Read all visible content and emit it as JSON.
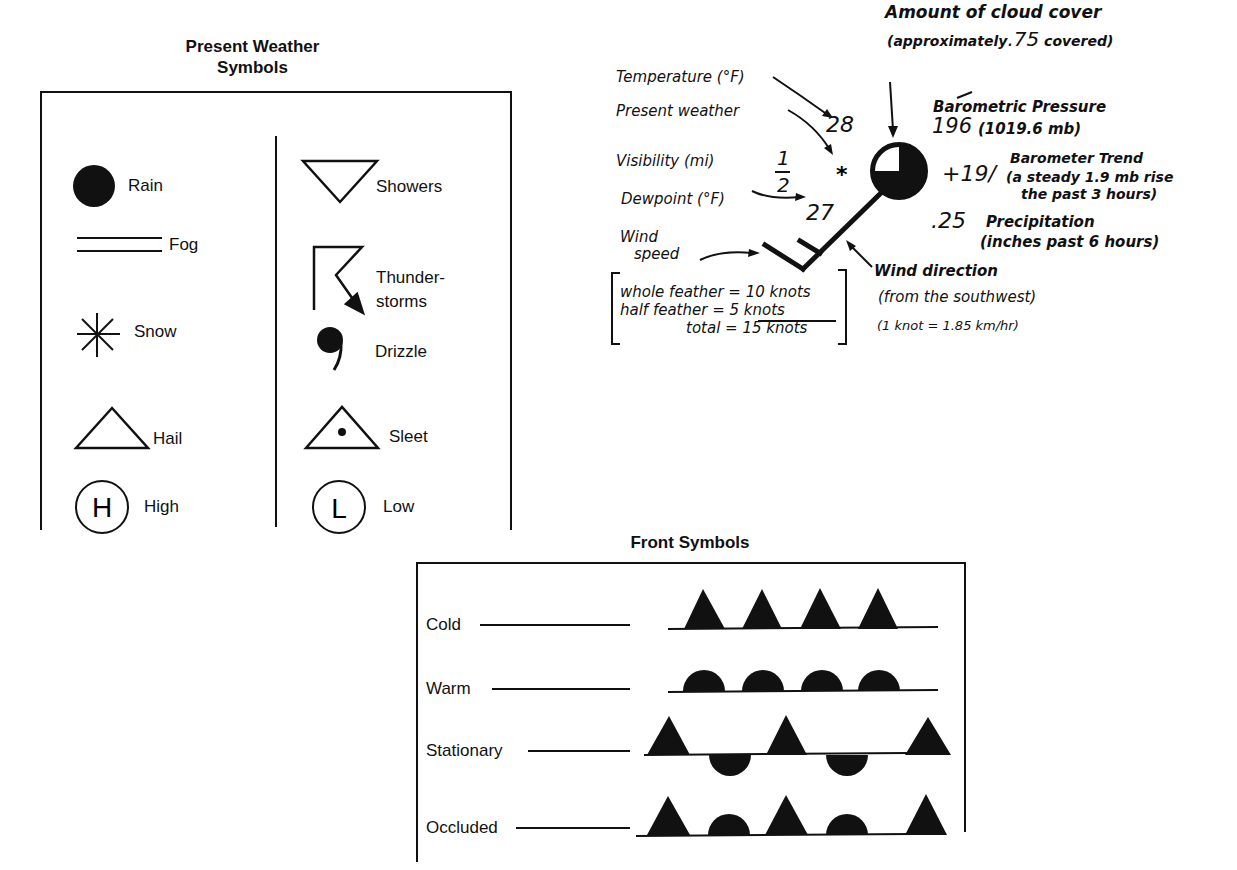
{
  "present_weather": {
    "title_line1": "Present Weather",
    "title_line2": "Symbols",
    "left_column": [
      {
        "symbol": "rain-icon",
        "label": "Rain"
      },
      {
        "symbol": "fog-icon",
        "label": "Fog"
      },
      {
        "symbol": "snow-icon",
        "label": "Snow"
      },
      {
        "symbol": "hail-icon",
        "label": "Hail"
      },
      {
        "symbol": "high-pressure-icon",
        "label": "High",
        "glyph": "H"
      }
    ],
    "right_column": [
      {
        "symbol": "showers-icon",
        "label": "Showers"
      },
      {
        "symbol": "thunderstorms-icon",
        "label_line1": "Thunder-",
        "label_line2": "storms"
      },
      {
        "symbol": "drizzle-icon",
        "label": "Drizzle"
      },
      {
        "symbol": "sleet-icon",
        "label": "Sleet"
      },
      {
        "symbol": "low-pressure-icon",
        "label": "Low",
        "glyph": "L"
      }
    ]
  },
  "station_model": {
    "cloud_cover": {
      "line1": "Amount of cloud cover",
      "line2_prefix": "(approximately",
      "value": ".75",
      "line2_suffix": "covered)"
    },
    "temperature": {
      "label": "Temperature (°F)",
      "value": "28"
    },
    "present_weather": {
      "label": "Present weather",
      "value": "*"
    },
    "visibility": {
      "label": "Visibility (mi)",
      "numerator": "1",
      "denominator": "2"
    },
    "dewpoint": {
      "label": "Dewpoint (°F)",
      "value": "27"
    },
    "barometric_pressure": {
      "label": "Barometric Pressure",
      "value": "196",
      "detail": "(1019.6 mb)"
    },
    "barometer_trend": {
      "value": "+19/",
      "label": "Barometer Trend",
      "line2": "(a steady 1.9 mb rise",
      "line3": "the past 3 hours)"
    },
    "precipitation": {
      "value": ".25",
      "label": "Precipitation",
      "line2": "(inches past 6 hours)"
    },
    "wind_speed": {
      "label_line1": "Wind",
      "label_line2": "speed",
      "whole_feather": "whole feather = 10 knots",
      "half_feather": "half feather =  5 knots",
      "total": "total = 15 knots"
    },
    "wind_direction": {
      "label": "Wind direction",
      "line2": "(from the southwest)",
      "conversion": "(1 knot = 1.85 km/hr)"
    }
  },
  "front_symbols": {
    "title": "Front Symbols",
    "rows": [
      {
        "label": "Cold",
        "pattern": "triangles"
      },
      {
        "label": "Warm",
        "pattern": "semicircles"
      },
      {
        "label": "Stationary",
        "pattern": "alternating-opposite"
      },
      {
        "label": "Occluded",
        "pattern": "alternating-same-side"
      }
    ]
  },
  "colors": {
    "ink": "#111111",
    "background": "#ffffff"
  }
}
